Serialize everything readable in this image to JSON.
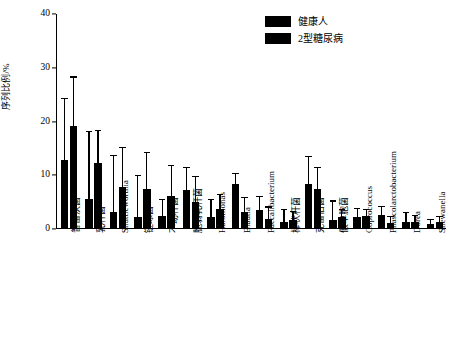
{
  "chart_data": {
    "type": "bar",
    "title": "",
    "xlabel": "",
    "ylabel": "序列比例/%",
    "ylim": [
      0,
      40
    ],
    "yticks": [
      0,
      10,
      20,
      30,
      40
    ],
    "grid": false,
    "legend_position": "top-right",
    "categories": [
      "普雷沃菌",
      "乳杆菌",
      "Shuttleworthia",
      "链球菌",
      "不动杆菌",
      "脆弱乳杆菌",
      "Halomonas",
      "Blautia",
      "Faecalibacterium",
      "棒状杆菌",
      "克雷伯菌",
      "假单胞菌",
      "Coprococcus",
      "Phascolarctobacterium",
      "Dorea",
      "Shewanella"
    ],
    "series": [
      {
        "name": "健康人",
        "color": "#000000",
        "values": [
          12.6,
          5.4,
          3.0,
          2.1,
          2.2,
          7.0,
          2.1,
          8.1,
          3.4,
          1.1,
          8.2,
          1.5,
          2.0,
          2.4,
          1.2,
          0.8
        ],
        "errors": [
          11.4,
          12.4,
          10.4,
          7.6,
          3.0,
          4.2,
          3.1,
          2.0,
          2.3,
          2.2,
          5.0,
          3.4,
          1.5,
          1.5,
          1.6,
          0.6
        ]
      },
      {
        "name": "2型糖尿病",
        "color": "#000000",
        "values": [
          19.0,
          12.1,
          7.6,
          7.3,
          5.9,
          4.8,
          3.6,
          3.0,
          1.6,
          1.4,
          7.2,
          2.0,
          2.2,
          1.0,
          1.1,
          1.2
        ],
        "errors": [
          9.0,
          6.0,
          7.2,
          6.6,
          5.6,
          4.6,
          2.6,
          2.5,
          2.2,
          1.6,
          4.0,
          1.4,
          1.2,
          1.0,
          1.1,
          0.9
        ]
      }
    ]
  },
  "legend": {
    "entries": [
      {
        "label": "健康人"
      },
      {
        "label": "2型糖尿病"
      }
    ]
  }
}
